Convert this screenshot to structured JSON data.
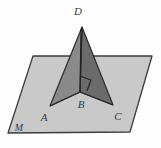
{
  "figure": {
    "type": "3d-geometry-diagram",
    "labels": {
      "apex": "D",
      "left_base": "A",
      "foot": "B",
      "right_base": "C",
      "plane": "M"
    },
    "colors": {
      "plane_fill": "#c9c9c9",
      "plane_stroke": "#3d3d3d",
      "left_face_fill": "#8a8a8a",
      "right_face_fill": "#6b6b6b",
      "edge_stroke": "#2b2b2b",
      "label_color": "#3a3a3a",
      "background": "#fefefe"
    },
    "geometry": {
      "plane_polygon": "33,56 152,56 130,132 8,133",
      "left_face_polygon": "82,27 50,106 80,92",
      "right_face_polygon": "82,27 113,105 80,92",
      "segment_BD": "80,92 82,27",
      "segment_AB": "50,106 80,92",
      "segment_BC": "80,92 113,105",
      "right_angle_marker": "at vertex B between BD and BC"
    },
    "annotations": {
      "right_angle": "90-degree mark at B"
    }
  }
}
